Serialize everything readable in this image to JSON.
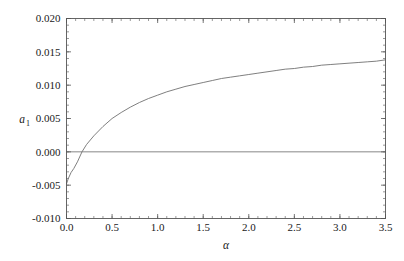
{
  "chart_data": {
    "type": "line",
    "title": "",
    "subtitle": "",
    "xlabel": "α",
    "ylabel": "a",
    "ylabel_sub": "1",
    "xlim": [
      0.0,
      3.5
    ],
    "ylim": [
      -0.01,
      0.02
    ],
    "grid": false,
    "legend": "none",
    "frame": true,
    "x_ticks": [
      "0.0",
      "0.5",
      "1.0",
      "1.5",
      "2.0",
      "2.5",
      "3.0",
      "3.5"
    ],
    "x_tick_values": [
      0.0,
      0.5,
      1.0,
      1.5,
      2.0,
      2.5,
      3.0,
      3.5
    ],
    "x_minor_step": 0.1,
    "y_ticks": [
      "-0.010",
      "-0.005",
      "0.000",
      "0.005",
      "0.010",
      "0.015",
      "0.020"
    ],
    "y_tick_values": [
      -0.01,
      -0.005,
      0.0,
      0.005,
      0.01,
      0.015,
      0.02
    ],
    "y_minor_step": 0.001,
    "reference_line_y": 0.0,
    "line_color": "#707070",
    "frame_color": "#555555",
    "reference_line_color": "#6a6a6a",
    "background_color": "#ffffff",
    "series": [
      {
        "name": "a1",
        "x": [
          0.0,
          0.02,
          0.05,
          0.08,
          0.12,
          0.17,
          0.22,
          0.3,
          0.4,
          0.5,
          0.6,
          0.7,
          0.8,
          0.9,
          1.0,
          1.1,
          1.2,
          1.3,
          1.4,
          1.5,
          1.6,
          1.7,
          1.8,
          1.9,
          2.0,
          2.1,
          2.2,
          2.3,
          2.4,
          2.5,
          2.6,
          2.7,
          2.8,
          2.9,
          3.0,
          3.1,
          3.2,
          3.3,
          3.4,
          3.5
        ],
        "values": [
          -0.0048,
          -0.004,
          -0.0031,
          -0.0025,
          -0.0015,
          0.0,
          0.0011,
          0.0024,
          0.0038,
          0.005,
          0.0059,
          0.0067,
          0.0074,
          0.008,
          0.0085,
          0.009,
          0.0094,
          0.0098,
          0.0101,
          0.0104,
          0.0107,
          0.011,
          0.0112,
          0.0114,
          0.0116,
          0.0118,
          0.012,
          0.0122,
          0.0124,
          0.0125,
          0.0127,
          0.0128,
          0.013,
          0.0131,
          0.0132,
          0.0133,
          0.0134,
          0.0135,
          0.0136,
          0.0138
        ]
      }
    ]
  }
}
